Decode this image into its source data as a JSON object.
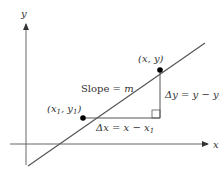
{
  "diagram": {
    "axes": {
      "x_label": "x",
      "y_label": "y"
    },
    "line": {
      "slope_label": "Slope = m",
      "color": "#555555"
    },
    "points": [
      {
        "label": "(x1, y1)",
        "label_parts": [
          "(x",
          "1",
          ", y",
          "1",
          ")"
        ]
      },
      {
        "label": "(x, y)"
      }
    ],
    "deltas": {
      "dx_label": "Δx = x − x1",
      "dx_parts": [
        "Δx = x − x",
        "1"
      ],
      "dy_label": "Δy = y − y1",
      "dy_parts": [
        "Δy = y − y",
        "1"
      ]
    }
  }
}
